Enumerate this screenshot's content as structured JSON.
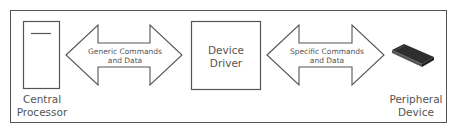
{
  "diagram": {
    "nodes": [
      {
        "id": "cpu",
        "label_line1": "Central",
        "label_line2": "Processor",
        "icon": "cpu-tower-icon"
      },
      {
        "id": "driver",
        "label_line1": "Device",
        "label_line2": "Driver"
      },
      {
        "id": "peripheral",
        "label_line1": "Peripheral",
        "label_line2": "Device",
        "icon": "hard-drive-icon"
      }
    ],
    "edges": [
      {
        "from": "cpu",
        "to": "driver",
        "label_line1": "Generic Commands",
        "label_line2": "and Data",
        "direction": "bidirectional"
      },
      {
        "from": "driver",
        "to": "peripheral",
        "label_line1": "Specific Commands",
        "label_line2": "and Data",
        "direction": "bidirectional"
      }
    ],
    "colors": {
      "stroke": "#555555",
      "text": "#555555",
      "device_fill": "#3a3a3a",
      "background": "#ffffff"
    }
  }
}
